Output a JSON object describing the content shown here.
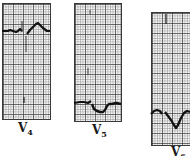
{
  "figure": {
    "grid_color": "#3a3a3a",
    "trace_color": "#111111",
    "leads": [
      {
        "letter": "V",
        "number": "4"
      },
      {
        "letter": "V",
        "number": "5"
      },
      {
        "letter": "V",
        "number": "6"
      }
    ]
  }
}
